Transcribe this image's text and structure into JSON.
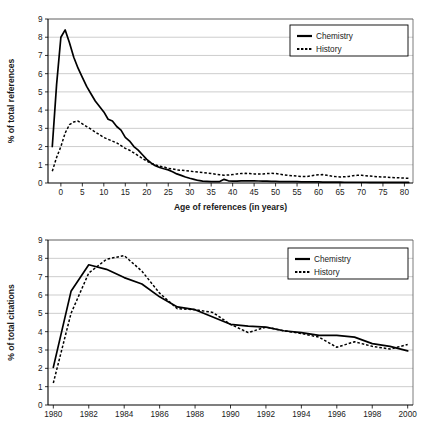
{
  "figure": {
    "background": "#ffffff",
    "line_color": "#000000",
    "grid_color": "#b8b8b8"
  },
  "chart_data": [
    {
      "id": "references-by-age",
      "type": "line",
      "title": "",
      "xlabel": "Age of references (in years)",
      "ylabel": "% of total references",
      "xlim": [
        -3,
        82
      ],
      "ylim": [
        0,
        9
      ],
      "grid": true,
      "legend_position": "top-right",
      "xticks": [
        0,
        5,
        10,
        15,
        20,
        25,
        30,
        35,
        40,
        45,
        50,
        55,
        60,
        65,
        70,
        75,
        80
      ],
      "yticks": [
        0,
        1,
        2,
        3,
        4,
        5,
        6,
        7,
        8,
        9
      ],
      "x": [
        -2,
        -1,
        0,
        1,
        2,
        3,
        4,
        5,
        6,
        7,
        8,
        9,
        10,
        11,
        12,
        13,
        14,
        15,
        16,
        17,
        18,
        19,
        20,
        21,
        22,
        23,
        24,
        25,
        26,
        27,
        28,
        29,
        30,
        31,
        32,
        33,
        34,
        35,
        36,
        37,
        38,
        39,
        40,
        41,
        42,
        43,
        44,
        45,
        46,
        47,
        48,
        49,
        50,
        51,
        52,
        53,
        54,
        55,
        56,
        57,
        58,
        59,
        60,
        61,
        62,
        63,
        64,
        65,
        66,
        67,
        68,
        69,
        70,
        71,
        72,
        73,
        74,
        75,
        76,
        77,
        78,
        79,
        80,
        81
      ],
      "series": [
        {
          "name": "Chemistry",
          "style": "solid",
          "values": [
            2.0,
            5.4,
            8.0,
            8.4,
            7.7,
            6.9,
            6.3,
            5.8,
            5.3,
            4.9,
            4.5,
            4.2,
            3.9,
            3.5,
            3.4,
            3.1,
            2.9,
            2.5,
            2.3,
            2.0,
            1.8,
            1.55,
            1.3,
            1.1,
            0.95,
            0.85,
            0.78,
            0.72,
            0.62,
            0.5,
            0.42,
            0.33,
            0.26,
            0.2,
            0.14,
            0.1,
            0.09,
            0.08,
            0.08,
            0.08,
            0.2,
            0.12,
            0.1,
            0.1,
            0.12,
            0.12,
            0.12,
            0.12,
            0.11,
            0.1,
            0.1,
            0.09,
            0.09,
            0.08,
            0.08,
            0.08,
            0.07,
            0.07,
            0.06,
            0.06,
            0.06,
            0.06,
            0.06,
            0.05,
            0.05,
            0.05,
            0.05,
            0.05,
            0.04,
            0.04,
            0.04,
            0.04,
            0.04,
            0.04,
            0.03,
            0.03,
            0.03,
            0.03,
            0.03,
            0.03,
            0.03,
            0.03,
            0.03,
            0.03
          ]
        },
        {
          "name": "History",
          "style": "dashed",
          "values": [
            0.65,
            1.4,
            2.0,
            2.75,
            3.2,
            3.35,
            3.4,
            3.25,
            3.1,
            2.95,
            2.8,
            2.65,
            2.5,
            2.4,
            2.3,
            2.2,
            2.05,
            1.9,
            1.8,
            1.65,
            1.5,
            1.35,
            1.2,
            1.08,
            1.0,
            0.92,
            0.88,
            0.8,
            0.78,
            0.72,
            0.7,
            0.68,
            0.65,
            0.62,
            0.6,
            0.58,
            0.55,
            0.52,
            0.48,
            0.45,
            0.43,
            0.44,
            0.46,
            0.5,
            0.52,
            0.53,
            0.52,
            0.5,
            0.5,
            0.5,
            0.52,
            0.53,
            0.52,
            0.48,
            0.45,
            0.42,
            0.4,
            0.38,
            0.36,
            0.35,
            0.38,
            0.42,
            0.45,
            0.46,
            0.42,
            0.38,
            0.35,
            0.33,
            0.34,
            0.36,
            0.4,
            0.42,
            0.42,
            0.4,
            0.38,
            0.36,
            0.34,
            0.33,
            0.32,
            0.3,
            0.29,
            0.28,
            0.27,
            0.26
          ]
        }
      ]
    },
    {
      "id": "citations-by-year",
      "type": "line",
      "title": "",
      "xlabel": "",
      "ylabel": "% of total citations",
      "xlim": [
        1979.7,
        2000.3
      ],
      "ylim": [
        0,
        9
      ],
      "grid": true,
      "legend_position": "top-right",
      "xticks": [
        1980,
        1982,
        1984,
        1986,
        1988,
        1990,
        1992,
        1994,
        1996,
        1998,
        2000
      ],
      "yticks": [
        0,
        1,
        2,
        3,
        4,
        5,
        6,
        7,
        8,
        9
      ],
      "x": [
        1980,
        1981,
        1982,
        1983,
        1984,
        1985,
        1986,
        1987,
        1988,
        1989,
        1990,
        1991,
        1992,
        1993,
        1994,
        1995,
        1996,
        1997,
        1998,
        1999,
        2000
      ],
      "series": [
        {
          "name": "Chemistry",
          "style": "solid",
          "values": [
            2.05,
            6.2,
            7.65,
            7.4,
            6.95,
            6.6,
            5.9,
            5.35,
            5.2,
            4.8,
            4.4,
            4.3,
            4.25,
            4.05,
            3.95,
            3.8,
            3.8,
            3.7,
            3.35,
            3.2,
            2.95
          ]
        },
        {
          "name": "History",
          "style": "dashed",
          "values": [
            1.2,
            5.0,
            7.2,
            7.95,
            8.15,
            7.3,
            6.1,
            5.25,
            5.2,
            5.05,
            4.4,
            3.95,
            4.25,
            4.05,
            3.9,
            3.7,
            3.15,
            3.45,
            3.2,
            3.05,
            3.3
          ]
        }
      ]
    }
  ],
  "charts": {
    "top": {
      "ylabel": "% of total references",
      "xlabel": "Age of references (in years)",
      "xticks": [
        "0",
        "5",
        "10",
        "15",
        "20",
        "25",
        "30",
        "35",
        "40",
        "45",
        "50",
        "55",
        "60",
        "65",
        "70",
        "75",
        "80"
      ],
      "yticks": [
        "0",
        "1",
        "2",
        "3",
        "4",
        "5",
        "6",
        "7",
        "8",
        "9"
      ],
      "legend": [
        {
          "label": "Chemistry",
          "style": "solid"
        },
        {
          "label": "History",
          "style": "dashed"
        }
      ]
    },
    "bottom": {
      "ylabel": "% of total citations",
      "xlabel": "",
      "xticks": [
        "1980",
        "1982",
        "1984",
        "1986",
        "1988",
        "1990",
        "1992",
        "1994",
        "1996",
        "1998",
        "2000"
      ],
      "yticks": [
        "0",
        "1",
        "2",
        "3",
        "4",
        "5",
        "6",
        "7",
        "8",
        "9"
      ],
      "legend": [
        {
          "label": "Chemistry",
          "style": "solid"
        },
        {
          "label": "History",
          "style": "dashed"
        }
      ]
    }
  }
}
